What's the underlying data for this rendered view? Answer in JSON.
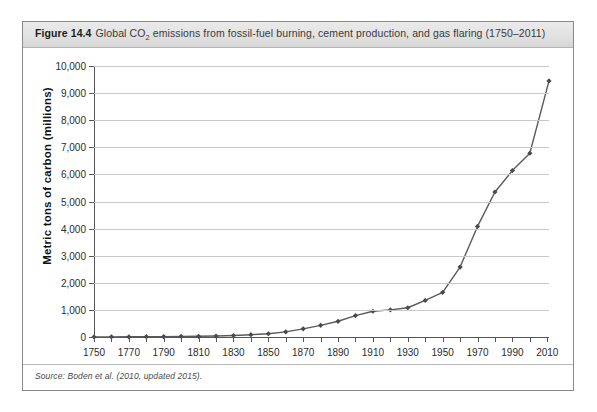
{
  "figure": {
    "label": "Figure 14.4",
    "caption_before_sub": "Global CO",
    "caption_sub": "2",
    "caption_after_sub": " emissions from fossil-fuel burning, cement production, and gas flaring (1750–2011)",
    "source_note": "Source: Boden et al. (2010, updated 2015)."
  },
  "chart_data": {
    "type": "line",
    "title": "Global CO2 emissions from fossil-fuel burning, cement production, and gas flaring (1750–2011)",
    "xlabel": "",
    "ylabel": "Metric tons of carbon (millions)",
    "xlim": [
      1750,
      2011
    ],
    "ylim": [
      0,
      10000
    ],
    "grid": true,
    "legend": "none",
    "line_color": "#5a5a5a",
    "marker_color": "#4a4a4a",
    "marker": "diamond",
    "y_ticks": [
      0,
      1000,
      2000,
      3000,
      4000,
      5000,
      6000,
      7000,
      8000,
      9000,
      10000
    ],
    "y_tick_labels": [
      "0",
      "1,000",
      "2,000",
      "3,000",
      "4,000",
      "5,000",
      "6,000",
      "7,000",
      "8,000",
      "9,000",
      "10,000"
    ],
    "x_ticks": [
      1750,
      1760,
      1770,
      1780,
      1790,
      1800,
      1810,
      1820,
      1830,
      1840,
      1850,
      1860,
      1870,
      1880,
      1890,
      1900,
      1910,
      1920,
      1930,
      1940,
      1950,
      1960,
      1970,
      1980,
      1990,
      2000,
      2010
    ],
    "x_tick_labels_shown": [
      "1750",
      "1770",
      "1790",
      "1810",
      "1830",
      "1850",
      "1870",
      "1890",
      "1910",
      "1930",
      "1950",
      "1970",
      "1990",
      "2010"
    ],
    "x": [
      1750,
      1760,
      1770,
      1780,
      1790,
      1800,
      1810,
      1820,
      1830,
      1840,
      1850,
      1860,
      1870,
      1880,
      1890,
      1900,
      1910,
      1920,
      1930,
      1940,
      1950,
      1960,
      1970,
      1980,
      1990,
      2000,
      2011
    ],
    "values": [
      3,
      5,
      8,
      12,
      15,
      20,
      25,
      35,
      55,
      85,
      120,
      190,
      300,
      430,
      580,
      790,
      950,
      1000,
      1080,
      1350,
      1650,
      2580,
      4080,
      5350,
      6140,
      6780,
      9450
    ],
    "series": [
      {
        "name": "Global CO2 emissions (million metric tons of carbon)",
        "values": [
          3,
          5,
          8,
          12,
          15,
          20,
          25,
          35,
          55,
          85,
          120,
          190,
          300,
          430,
          580,
          790,
          950,
          1000,
          1080,
          1350,
          1650,
          2580,
          4080,
          5350,
          6140,
          6780,
          9450
        ]
      }
    ]
  }
}
